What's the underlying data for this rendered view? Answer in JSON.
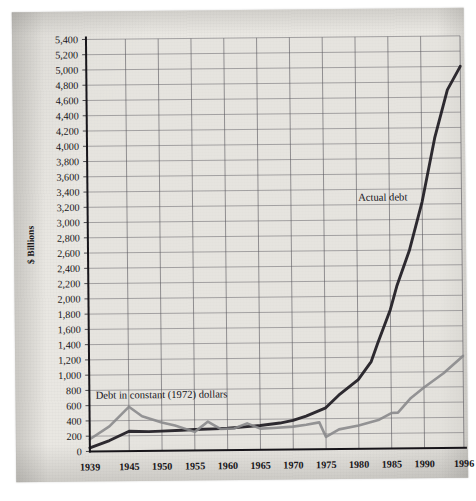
{
  "chart_data": {
    "type": "line",
    "title": "",
    "subtitle": "",
    "xlabel": "",
    "ylabel": "$ Billions",
    "xlim": [
      1939,
      1996
    ],
    "ylim": [
      0,
      5400
    ],
    "ytick_step": 200,
    "grid": true,
    "legend_position": "inline-annotations",
    "x_tick_labels": [
      "1939",
      "1945",
      "1950",
      "1955",
      "1960",
      "1965",
      "1970",
      "1975",
      "1980",
      "1985",
      "1990",
      "1996"
    ],
    "x_tick_values": [
      1939,
      1945,
      1950,
      1955,
      1960,
      1965,
      1970,
      1975,
      1980,
      1985,
      1990,
      1996
    ],
    "y_tick_labels": [
      "0",
      "200",
      "400",
      "600",
      "800",
      "1,000",
      "1,200",
      "1,400",
      "1,600",
      "1,800",
      "2,000",
      "2,200",
      "2,400",
      "2,600",
      "2,800",
      "3,000",
      "3,200",
      "3,400",
      "3,600",
      "3,800",
      "4,000",
      "4,200",
      "4,400",
      "4,600",
      "4,800",
      "5,000",
      "5,200",
      "5,400"
    ],
    "y_tick_values": [
      0,
      200,
      400,
      600,
      800,
      1000,
      1200,
      1400,
      1600,
      1800,
      2000,
      2200,
      2400,
      2600,
      2800,
      3000,
      3200,
      3400,
      3600,
      3800,
      4000,
      4200,
      4400,
      4600,
      4800,
      5000,
      5200,
      5400
    ],
    "series": [
      {
        "name": "Actual debt",
        "color": "#232026",
        "annotation": "Actual debt",
        "annotation_x": 1984,
        "annotation_y": 3250,
        "x": [
          1939,
          1942,
          1945,
          1948,
          1950,
          1953,
          1955,
          1958,
          1960,
          1963,
          1965,
          1968,
          1970,
          1972,
          1975,
          1977,
          1980,
          1982,
          1983,
          1985,
          1986,
          1988,
          1990,
          1992,
          1994,
          1996
        ],
        "y": [
          48,
          140,
          260,
          252,
          257,
          266,
          274,
          280,
          287,
          306,
          318,
          348,
          381,
          436,
          542,
          706,
          908,
          1142,
          1377,
          1823,
          2125,
          2601,
          3233,
          4065,
          4693,
          5000
        ]
      },
      {
        "name": "Debt in constant (1972) dollars",
        "color": "#8a8a8c",
        "annotation": "Debt in constant (1972) dollars",
        "annotation_x": 1950,
        "annotation_y": 690,
        "x": [
          1939,
          1942,
          1945,
          1947,
          1950,
          1952,
          1955,
          1957,
          1959,
          1961,
          1963,
          1965,
          1967,
          1970,
          1972,
          1974,
          1975,
          1977,
          1980,
          1983,
          1985,
          1986,
          1988,
          1990,
          1993,
          1996
        ],
        "y": [
          160,
          325,
          580,
          455,
          370,
          330,
          243,
          375,
          277,
          283,
          348,
          278,
          285,
          300,
          323,
          352,
          160,
          258,
          305,
          375,
          465,
          470,
          660,
          795,
          980,
          1205
        ]
      }
    ]
  },
  "axis": {
    "y_axis_title": "$ Billions"
  }
}
